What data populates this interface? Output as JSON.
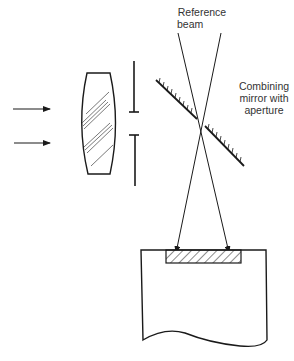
{
  "labels": {
    "reference_beam": [
      "Reference",
      "beam"
    ],
    "combining_mirror": [
      "Combining",
      "mirror with",
      "aperture"
    ]
  },
  "colors": {
    "line": "#1a1a1a",
    "text": "#333333",
    "background": "#ffffff"
  },
  "components": [
    {
      "name": "incident-light-arrows",
      "count": 2
    },
    {
      "name": "lens"
    },
    {
      "name": "aperture-stop"
    },
    {
      "name": "combining-mirror-with-aperture"
    },
    {
      "name": "reference-beam"
    },
    {
      "name": "recording-medium"
    }
  ]
}
